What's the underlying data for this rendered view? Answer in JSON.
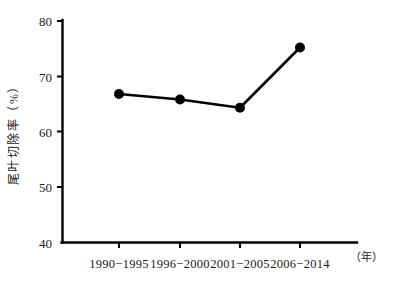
{
  "chart_data": {
    "type": "line",
    "title": "",
    "xlabel": "",
    "ylabel": "尾叶切除率（%）",
    "x_unit": "（年）",
    "y_unit": "%",
    "categories": [
      "1990−1995",
      "1996−2000",
      "2001−2005",
      "2006−2014"
    ],
    "values": [
      66.8,
      65.8,
      64.3,
      75.2
    ],
    "ylim": [
      40,
      80
    ],
    "yticks": [
      40,
      50,
      60,
      70,
      80
    ],
    "ytick_labels": [
      "40",
      "50",
      "60",
      "70",
      "80"
    ],
    "grid": false,
    "legend": null,
    "series": [
      {
        "name": "尾叶切除率",
        "values": [
          66.8,
          65.8,
          64.3,
          75.2
        ],
        "color": "#000000",
        "marker": "circle"
      }
    ]
  },
  "axes": {
    "y_title": "尾叶切除率（%）",
    "x_unit_note": "（年）",
    "tick_40": "40",
    "tick_50": "50",
    "tick_60": "60",
    "tick_70": "70",
    "tick_80": "80",
    "cat_1": "1990−1995",
    "cat_2": "1996−2000",
    "cat_3": "2001−2005",
    "cat_4": "2006−2014"
  },
  "colors": {
    "background": "#ffffff",
    "ink": "#000000",
    "series": "#000000"
  }
}
